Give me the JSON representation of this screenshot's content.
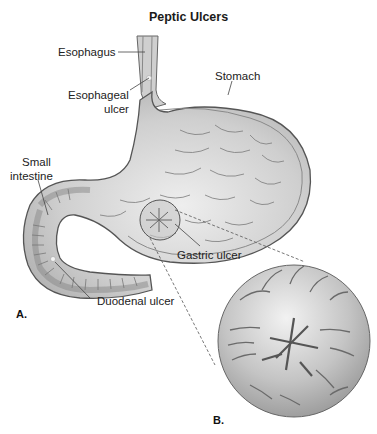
{
  "title": "Peptic Ulcers",
  "labels": {
    "esophagus": "Esophagus",
    "esophageal_ulcer_line1": "Esophageal",
    "esophageal_ulcer_line2": "ulcer",
    "stomach": "Stomach",
    "small_intestine_line1": "Small",
    "small_intestine_line2": "intestine",
    "gastric_ulcer": "Gastric ulcer",
    "duodenal_ulcer": "Duodenal ulcer"
  },
  "panels": {
    "a": "A.",
    "b": "B."
  },
  "colors": {
    "organ_fill": "#b9b9b9",
    "organ_light": "#e4e4e4",
    "organ_wall": "#8c8c8c",
    "outline": "#555555",
    "fold": "#7a7a7a"
  }
}
